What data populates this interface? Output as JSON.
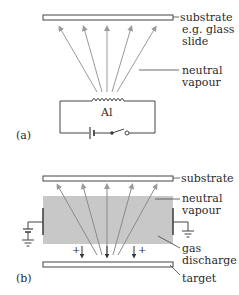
{
  "panel_a": {
    "label": "(a)",
    "substrate_label_line1": "substrate",
    "substrate_label_line2": "e.g. glass",
    "substrate_label_line3": "slide",
    "vapour_label_line1": "neutral",
    "vapour_label_line2": "vapour",
    "filament_label": "Al"
  },
  "panel_b": {
    "label": "(b)",
    "substrate_label": "substrate",
    "vapour_label_line1": "neutral",
    "vapour_label_line2": "vapour",
    "discharge_label_line1": "gas",
    "discharge_label_line2": "discharge",
    "target_label": "target",
    "ion_sign_left": "+",
    "ion_sign_right": "+"
  },
  "colors": {
    "line": "#3a3a3a",
    "arrow": "#9a9a9a",
    "discharge_fill": "#c8c8c8",
    "plate_fill": "#ffffff"
  }
}
